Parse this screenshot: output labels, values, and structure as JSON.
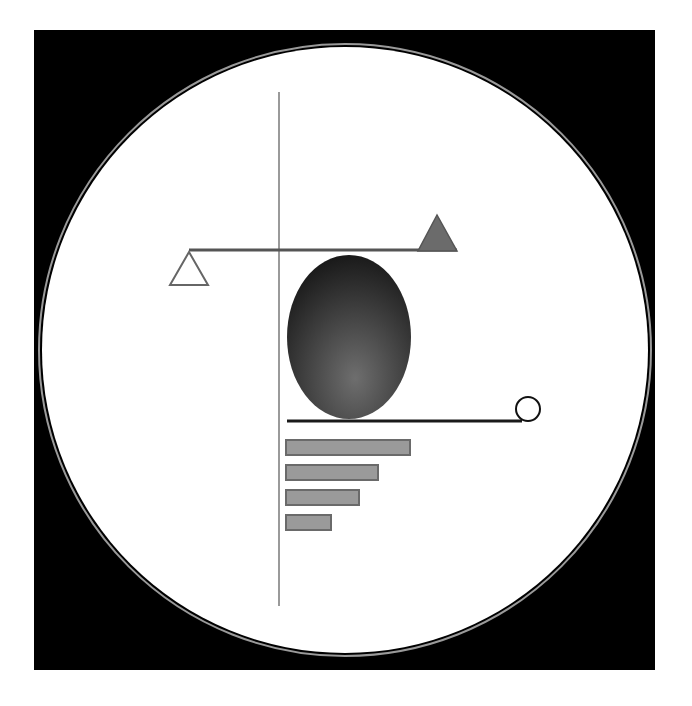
{
  "artwork": {
    "canvas": {
      "width": 692,
      "height": 706,
      "background": "#ffffff"
    },
    "frame": {
      "x": 34,
      "y": 30,
      "width": 621,
      "height": 640,
      "color": "#000000"
    },
    "circle": {
      "cx": 345,
      "cy": 350,
      "r": 303,
      "fill": "#ffffff",
      "ring_color": "#9a9a9a"
    },
    "vertical_line": {
      "x": 279,
      "y1": 92,
      "y2": 606,
      "color": "#9a9a9a",
      "width": 2
    },
    "beam": {
      "x1": 189,
      "x2": 457,
      "y": 250,
      "color": "#555555",
      "width": 3
    },
    "left_triangle": {
      "points": "189,252 170,285 208,285",
      "fill": "none",
      "stroke": "#666666"
    },
    "right_triangle": {
      "points": "437,215 418,251 457,251",
      "fill": "#6b6b6b",
      "stroke": "#555555"
    },
    "egg": {
      "cx": 349,
      "cy": 337,
      "rx": 62,
      "ry": 82,
      "color_dark": "#141414",
      "color_light": "#6e6e6e"
    },
    "base_line": {
      "x1": 287,
      "x2": 522,
      "y": 421,
      "color": "#1a1a1a",
      "width": 3
    },
    "small_circle": {
      "cx": 528,
      "cy": 409,
      "r": 12,
      "stroke": "#111111"
    },
    "bars": [
      {
        "x": 286,
        "y": 440,
        "width": 124,
        "height": 15
      },
      {
        "x": 286,
        "y": 465,
        "width": 92,
        "height": 15
      },
      {
        "x": 286,
        "y": 490,
        "width": 73,
        "height": 15
      },
      {
        "x": 286,
        "y": 515,
        "width": 45,
        "height": 15
      }
    ],
    "bar_fill": "#9a9a9a",
    "bar_stroke": "#6a6a6a"
  }
}
